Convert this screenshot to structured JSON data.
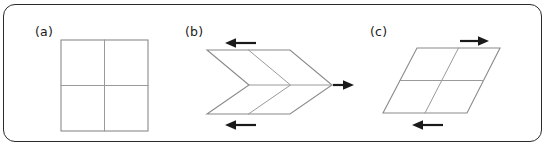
{
  "figure": {
    "width": 547,
    "height": 147,
    "background_color": "#ffffff",
    "frame": {
      "visible": true,
      "stroke_color": "#2b2b2b",
      "corner_radius": 12
    },
    "shape_stroke_color": "#8a8a8a",
    "arrow_color": "#1a1a1a",
    "label_color": "#1a1a1a"
  },
  "panels": [
    {
      "id": "a",
      "label": "(a)",
      "shape": "square-grid",
      "description": "undeformed 2 by 2 square grid",
      "grid_rows": 2,
      "grid_cols": 2,
      "shear": 0,
      "arrows": []
    },
    {
      "id": "b",
      "label": "(b)",
      "shape": "chevron-grid",
      "description": "antisymmetric chevron deformation of a 2 by 2 grid",
      "grid_rows": 2,
      "grid_cols": 2,
      "arrows": [
        {
          "name": "top-arrow",
          "direction": "left"
        },
        {
          "name": "middle-arrow",
          "direction": "right"
        },
        {
          "name": "bottom-arrow",
          "direction": "left"
        }
      ]
    },
    {
      "id": "c",
      "label": "(c)",
      "shape": "sheared-parallelogram-grid",
      "description": "simple shear deformation of a 2 by 2 grid",
      "grid_rows": 2,
      "grid_cols": 2,
      "arrows": [
        {
          "name": "top-arrow",
          "direction": "right"
        },
        {
          "name": "bottom-arrow",
          "direction": "left"
        }
      ]
    }
  ]
}
